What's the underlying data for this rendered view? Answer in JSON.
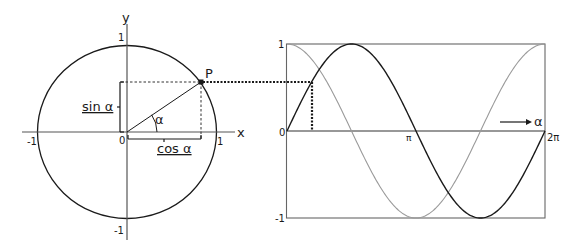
{
  "diagram": {
    "colors": {
      "line": "#1a1a1a",
      "sine": "#1a1a1a",
      "cosine": "#9a9a9a",
      "frame": "#555555",
      "background": "#ffffff"
    },
    "unit_circle": {
      "axis_labels": {
        "x": "x",
        "y": "y"
      },
      "tick_labels": {
        "x_neg": "-1",
        "x_pos": "1",
        "y_pos": "1",
        "y_neg": "-1",
        "origin": "0"
      },
      "point_label": "P",
      "angle_label": "α",
      "sin_label": "sin α",
      "cos_label": "cos α",
      "angle_degrees": 35
    },
    "wave_graph": {
      "y_tick_labels": {
        "top": "1",
        "zero": "0",
        "bottom": "-1"
      },
      "x_tick_labels": {
        "pi": "π",
        "two_pi": "2π"
      },
      "x_axis_label": "α",
      "curves": [
        {
          "name": "sin α",
          "style": "solid-dark"
        },
        {
          "name": "cos α",
          "style": "solid-light"
        }
      ]
    }
  }
}
